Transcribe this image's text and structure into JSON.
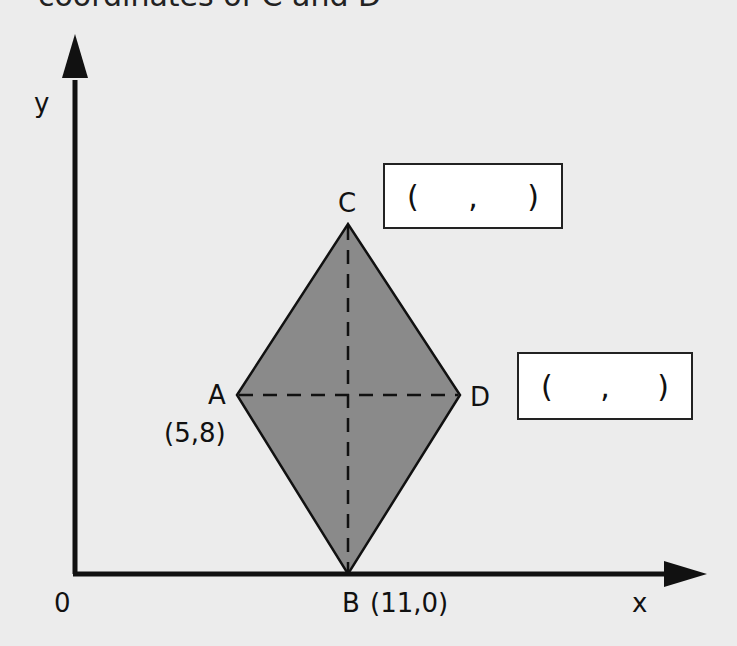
{
  "heading": "coordinates of C and D",
  "axes": {
    "x_label": "x",
    "y_label": "y",
    "origin_label": "0"
  },
  "points": {
    "A": {
      "label": "A",
      "coord": "(5,8)"
    },
    "B": {
      "label": "B",
      "coord": "(11,0)"
    },
    "C": {
      "label": "C"
    },
    "D": {
      "label": "D"
    }
  },
  "answer_boxes": {
    "C": {
      "open": "(",
      "sep": ",",
      "close": ")"
    },
    "D": {
      "open": "(",
      "sep": ",",
      "close": ")"
    }
  },
  "colors": {
    "fill": "#8a8a8a",
    "stroke": "#111111",
    "background": "#ececec"
  }
}
